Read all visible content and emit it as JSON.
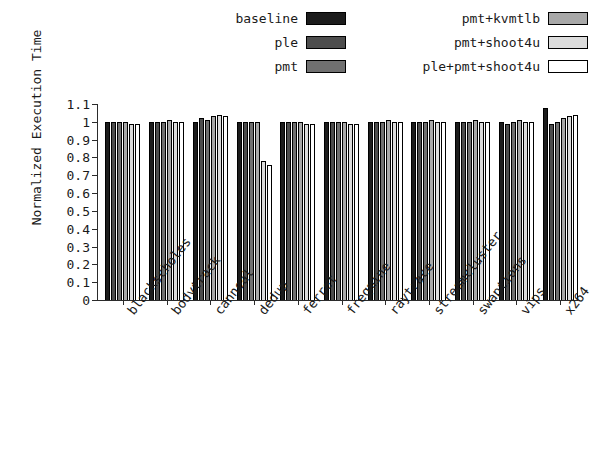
{
  "chart_data": {
    "type": "bar",
    "title": "",
    "xlabel": "",
    "ylabel": "Normalized Execution Time",
    "ylim": [
      0,
      1.1
    ],
    "ytick_labels": [
      "1.1",
      "1",
      "0.9",
      "0.8",
      "0.7",
      "0.6",
      "0.5",
      "0.4",
      "0.3",
      "0.2",
      "0.1",
      "0"
    ],
    "ytick_values": [
      1.1,
      1.0,
      0.9,
      0.8,
      0.7,
      0.6,
      0.5,
      0.4,
      0.3,
      0.2,
      0.1,
      0
    ],
    "grid": false,
    "legend_position": "top",
    "categories": [
      "blackscholes",
      "bodytrack",
      "canneal",
      "dedup",
      "ferret",
      "freqmine",
      "raytrace",
      "streamcluster",
      "swaptions",
      "vips",
      "x264"
    ],
    "series": [
      {
        "name": "baseline",
        "color": "#1c1c1c",
        "values": [
          1.0,
          1.0,
          1.0,
          1.0,
          1.0,
          1.0,
          1.0,
          1.0,
          1.0,
          1.0,
          1.08
        ]
      },
      {
        "name": "ple",
        "color": "#4d4d4d",
        "values": [
          1.0,
          1.0,
          1.02,
          1.0,
          1.0,
          1.0,
          1.0,
          1.0,
          1.0,
          0.99,
          0.99
        ]
      },
      {
        "name": "pmt",
        "color": "#707070",
        "values": [
          1.0,
          1.0,
          1.01,
          1.0,
          1.0,
          1.0,
          1.0,
          1.0,
          1.0,
          1.0,
          1.0
        ]
      },
      {
        "name": "pmt+kvmtlb",
        "color": "#a8a8a8",
        "values": [
          1.0,
          1.01,
          1.03,
          1.0,
          1.0,
          1.0,
          1.01,
          1.01,
          1.01,
          1.01,
          1.02
        ]
      },
      {
        "name": "pmt+shoot4u",
        "color": "#dcdcdc",
        "values": [
          0.99,
          1.0,
          1.04,
          0.78,
          0.99,
          0.99,
          1.0,
          1.0,
          1.0,
          1.0,
          1.03
        ]
      },
      {
        "name": "ple+pmt+shoot4u",
        "color": "#ffffff",
        "values": [
          0.99,
          1.0,
          1.03,
          0.76,
          0.99,
          0.99,
          1.0,
          1.0,
          1.0,
          1.0,
          1.04
        ]
      }
    ]
  },
  "legend": {
    "column_left": [
      {
        "label": "baseline",
        "color": "#1c1c1c"
      },
      {
        "label": "ple",
        "color": "#4d4d4d"
      },
      {
        "label": "pmt",
        "color": "#707070"
      }
    ],
    "column_right": [
      {
        "label": "pmt+kvmtlb",
        "color": "#a8a8a8"
      },
      {
        "label": "pmt+shoot4u",
        "color": "#dcdcdc"
      },
      {
        "label": "ple+pmt+shoot4u",
        "color": "#ffffff"
      }
    ]
  }
}
